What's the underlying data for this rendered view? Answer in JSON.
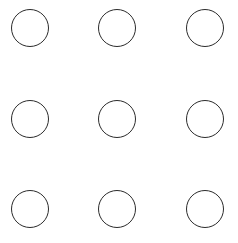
{
  "canvas": {
    "width": 238,
    "height": 243,
    "background_color": "#ffffff"
  },
  "grid": {
    "name": "circle-grid",
    "rows": 3,
    "columns": 3,
    "count": 9,
    "column_centers_x": [
      30,
      117,
      205
    ],
    "row_centers_y": [
      28,
      119,
      209
    ],
    "column_pitch": 87,
    "row_pitch": 90,
    "margins": {
      "left": 11,
      "right": 14,
      "top": 9,
      "bottom": 15
    }
  },
  "shape_style": {
    "shape": "circle",
    "diameter": 38,
    "stroke_width": 1.5,
    "stroke_color": "#2b2b2b",
    "fill_color": "none"
  },
  "circles": [
    {
      "id": "circle-r1-c1",
      "row": 1,
      "column": 1,
      "center_x": 30,
      "center_y": 28,
      "diameter": 38
    },
    {
      "id": "circle-r1-c2",
      "row": 1,
      "column": 2,
      "center_x": 117,
      "center_y": 28,
      "diameter": 38
    },
    {
      "id": "circle-r1-c3",
      "row": 1,
      "column": 3,
      "center_x": 205,
      "center_y": 28,
      "diameter": 38
    },
    {
      "id": "circle-r2-c1",
      "row": 2,
      "column": 1,
      "center_x": 30,
      "center_y": 119,
      "diameter": 38
    },
    {
      "id": "circle-r2-c2",
      "row": 2,
      "column": 2,
      "center_x": 117,
      "center_y": 119,
      "diameter": 38
    },
    {
      "id": "circle-r2-c3",
      "row": 2,
      "column": 3,
      "center_x": 205,
      "center_y": 119,
      "diameter": 38
    },
    {
      "id": "circle-r3-c1",
      "row": 3,
      "column": 1,
      "center_x": 30,
      "center_y": 209,
      "diameter": 38
    },
    {
      "id": "circle-r3-c2",
      "row": 3,
      "column": 2,
      "center_x": 117,
      "center_y": 209,
      "diameter": 38
    },
    {
      "id": "circle-r3-c3",
      "row": 3,
      "column": 3,
      "center_x": 205,
      "center_y": 209,
      "diameter": 38
    }
  ]
}
